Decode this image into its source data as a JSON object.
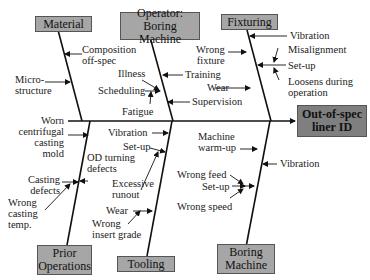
{
  "effect": {
    "line1": "Out-of-spec",
    "line2": "liner ID"
  },
  "categories": {
    "material": "Material",
    "operator": {
      "line1": "Operator:",
      "line2": "Boring Machine"
    },
    "fixturing": "Fixturing",
    "prior": {
      "line1": "Prior",
      "line2": "Operations"
    },
    "tooling": "Tooling",
    "boring": {
      "line1": "Boring",
      "line2": "Machine"
    }
  },
  "causes": {
    "material": {
      "composition": [
        "Composition",
        "off-spec"
      ],
      "microstructure": [
        "Micro-",
        "structure"
      ]
    },
    "operator": {
      "illness": "Illness",
      "scheduling": "Scheduling",
      "fatigue": "Fatigue",
      "training": "Training",
      "wear": "Wear",
      "supervision": "Supervision"
    },
    "fixturing": {
      "vibration": "Vibration",
      "wrong_fixture": [
        "Wrong",
        "fixture"
      ],
      "misalignment": "Misalignment",
      "setup": "Set-up",
      "loosens": [
        "Loosens during",
        "operation"
      ]
    },
    "prior": {
      "worn_mold": [
        "Worn",
        "centrifugal",
        "casting",
        "mold"
      ],
      "od_turning": [
        "OD turning",
        "defects"
      ],
      "casting_defects": [
        "Casting",
        "defects"
      ],
      "wrong_temp": [
        "Wrong",
        "casting",
        "temp."
      ]
    },
    "tooling": {
      "vibration": "Vibration",
      "setup": "Set-up",
      "runout": [
        "Excessive",
        "runout"
      ],
      "wear": "Wear",
      "insert": [
        "Wrong",
        "insert grade"
      ]
    },
    "boring": {
      "warmup": [
        "Machine",
        "warm-up"
      ],
      "vibration": "Vibration",
      "wrong_feed": "Wrong feed",
      "setup": "Set-up",
      "wrong_speed": "Wrong speed"
    }
  }
}
